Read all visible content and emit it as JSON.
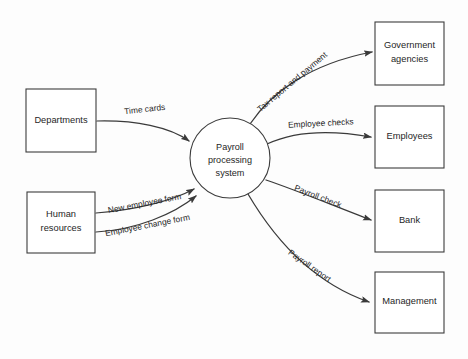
{
  "diagram": {
    "type": "data-flow-diagram",
    "background_color": "#fdfdfd",
    "line_color": "#3a3a3a",
    "text_color": "#262626",
    "process": {
      "shape": "circle",
      "label_line1": "Payroll",
      "label_line2": "processing",
      "label_line3": "system",
      "center_x": 230,
      "center_y": 158,
      "radius": 40
    },
    "external_entities": [
      {
        "id": "departments",
        "shape": "rectangle",
        "label_line1": "Departments",
        "label_line2": "",
        "x": 26,
        "y": 89,
        "width": 70,
        "height": 63,
        "side": "left"
      },
      {
        "id": "human-resources",
        "shape": "rectangle",
        "label_line1": "Human",
        "label_line2": "resources",
        "x": 27,
        "y": 192,
        "width": 68,
        "height": 61,
        "side": "left"
      },
      {
        "id": "government-agencies",
        "shape": "rectangle",
        "label_line1": "Government",
        "label_line2": "agencies",
        "x": 375,
        "y": 22,
        "width": 69,
        "height": 63,
        "side": "right"
      },
      {
        "id": "employees",
        "shape": "rectangle",
        "label_line1": "Employees",
        "label_line2": "",
        "x": 375,
        "y": 106,
        "width": 69,
        "height": 62,
        "side": "right"
      },
      {
        "id": "bank",
        "shape": "rectangle",
        "label_line1": "Bank",
        "label_line2": "",
        "x": 375,
        "y": 190,
        "width": 69,
        "height": 62,
        "side": "right"
      },
      {
        "id": "management",
        "shape": "rectangle",
        "label_line1": "Management",
        "label_line2": "",
        "x": 375,
        "y": 272,
        "width": 69,
        "height": 61,
        "side": "right"
      }
    ],
    "data_flows": [
      {
        "id": "time-cards",
        "label": "Time cards",
        "from": "departments",
        "to": "payroll-processing-system",
        "direction": "inbound"
      },
      {
        "id": "new-employee-form",
        "label": "New employee form",
        "from": "human-resources",
        "to": "payroll-processing-system",
        "direction": "inbound"
      },
      {
        "id": "employee-change-form",
        "label": "Employee change form",
        "from": "human-resources",
        "to": "payroll-processing-system",
        "direction": "inbound"
      },
      {
        "id": "tax-report-and-payment",
        "label": "Tax report and payment",
        "from": "payroll-processing-system",
        "to": "government-agencies",
        "direction": "outbound"
      },
      {
        "id": "employee-checks",
        "label": "Employee checks",
        "from": "payroll-processing-system",
        "to": "employees",
        "direction": "outbound"
      },
      {
        "id": "payroll-check",
        "label": "Payroll check",
        "from": "payroll-processing-system",
        "to": "bank",
        "direction": "outbound"
      },
      {
        "id": "payroll-report",
        "label": "Payroll report",
        "from": "payroll-processing-system",
        "to": "management",
        "direction": "outbound"
      }
    ]
  }
}
